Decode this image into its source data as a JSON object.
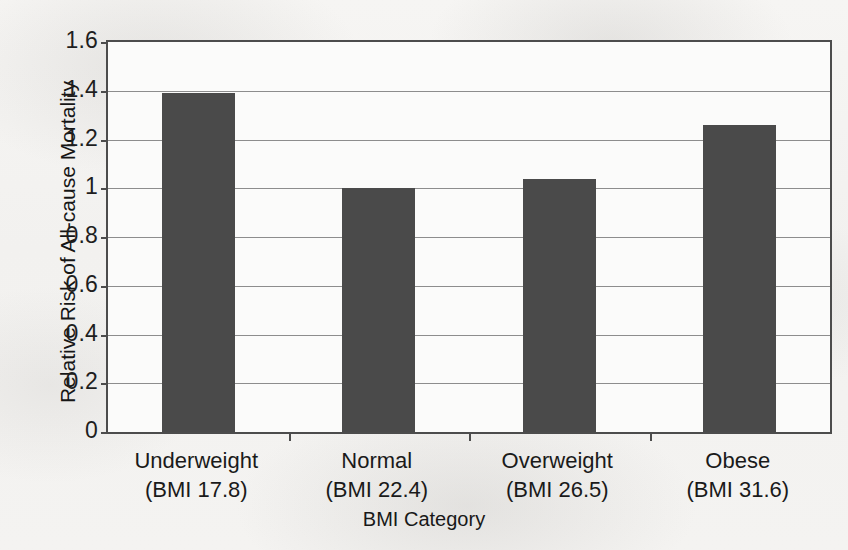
{
  "chart_data": {
    "type": "bar",
    "title": "",
    "xlabel": "BMI Category",
    "ylabel": "Relative Risk of All-cause Mortality",
    "categories": [
      "Underweight",
      "Normal",
      "Overweight",
      "Obese"
    ],
    "category_sublabels": [
      "(BMI 17.8)",
      "(BMI 22.4)",
      "(BMI 26.5)",
      "(BMI 31.6)"
    ],
    "values": [
      1.39,
      1.0,
      1.04,
      1.26
    ],
    "ylim": [
      0,
      1.6
    ],
    "ytick_step": 0.2,
    "ytick_labels": [
      "1.6",
      "1.4",
      "1.2",
      "1",
      "0.8",
      "0.6",
      "0.4",
      "0.2",
      "0"
    ],
    "ytick_values": [
      1.6,
      1.4,
      1.2,
      1.0,
      0.8,
      0.6,
      0.4,
      0.2,
      0
    ],
    "grid": true,
    "grid_axis": "y",
    "legend": false,
    "legend_position": "none",
    "bar_color": "#4a4a4a",
    "axis_color": "#4c4c4c",
    "gridline_color": "#8d8d8d",
    "background_color": "#f4f3f1",
    "plot_background_color": "#fbfbfa"
  }
}
